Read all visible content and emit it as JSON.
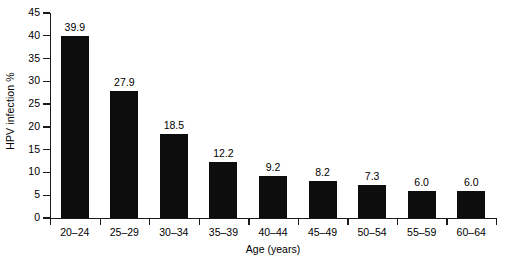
{
  "chart_data": {
    "type": "bar",
    "title": "",
    "xlabel": "Age (years)",
    "ylabel": "HPV infection %",
    "categories": [
      "20–24",
      "25–29",
      "30–34",
      "35–39",
      "40–44",
      "45–49",
      "50–54",
      "55–59",
      "60–64"
    ],
    "values": [
      39.9,
      27.9,
      18.5,
      12.2,
      9.2,
      8.2,
      7.3,
      6.0,
      6.0
    ],
    "value_labels": [
      "39.9",
      "27.9",
      "18.5",
      "12.2",
      "9.2",
      "8.2",
      "7.3",
      "6.0",
      "6.0"
    ],
    "ylim": [
      0,
      45
    ],
    "ytick_step": 5,
    "ytick_labels": [
      "0",
      "5",
      "10",
      "15",
      "20",
      "25",
      "30",
      "35",
      "40",
      "45"
    ],
    "grid": false,
    "legend": null,
    "bar_color": "#0d0d0d",
    "axis_color": "#1a1a1a",
    "background_color": "#ffffff"
  }
}
